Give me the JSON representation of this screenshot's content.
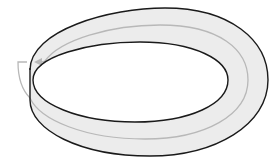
{
  "figure": {
    "colors": {
      "background": "#ffffff",
      "band_fill": "#ececec",
      "outline": "#1a1a1a",
      "centerline": "#b8b8b8"
    }
  }
}
